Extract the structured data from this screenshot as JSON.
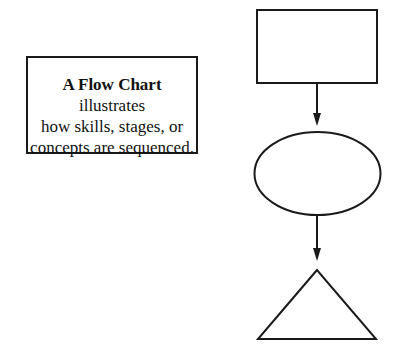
{
  "caption": {
    "bold_term": "A Flow Chart",
    "line1_rest": " illustrates",
    "line2": "how skills, stages, or",
    "line3": "concepts are sequenced."
  },
  "diagram": {
    "shapes": [
      "rectangle",
      "ellipse",
      "triangle"
    ],
    "connectors": [
      "arrow-down",
      "arrow-down"
    ],
    "stroke_color": "#1a1a1a",
    "fill_color": "#ffffff"
  }
}
